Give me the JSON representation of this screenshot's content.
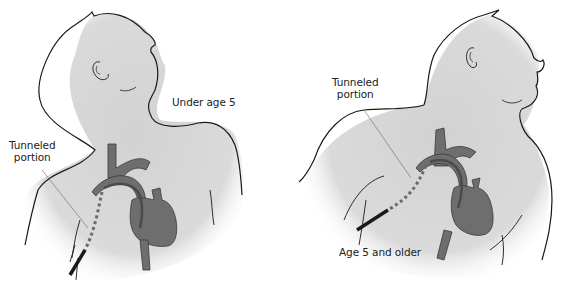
{
  "figure": {
    "colors": {
      "skin_fill": "#d9d9d9",
      "outline": "#1a1a1a",
      "vessel_fill": "#6e6e6e",
      "vessel_stroke": "#3a3a3a",
      "catheter": "#4a4a4a",
      "background": "#ffffff"
    },
    "panels": [
      {
        "id": "under-5",
        "age_label": "Under age 5",
        "callout_label_line1": "Tunneled",
        "callout_label_line2": "portion"
      },
      {
        "id": "5-and-older",
        "age_label": "Age 5 and older",
        "callout_label_line1": "Tunneled",
        "callout_label_line2": "portion"
      }
    ]
  }
}
